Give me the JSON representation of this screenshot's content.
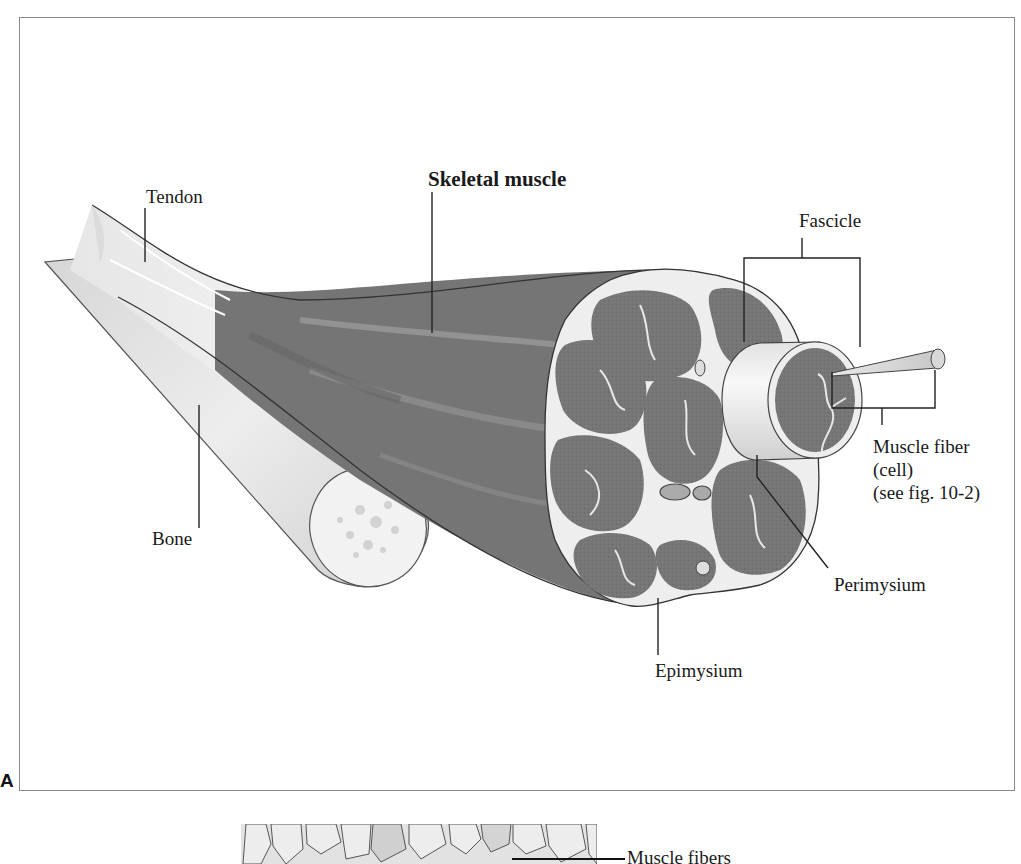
{
  "figure": {
    "panel_a": {
      "letter": "A",
      "labels": {
        "tendon": "Tendon",
        "skeletal_muscle": "Skeletal muscle",
        "fascicle": "Fascicle",
        "muscle_fiber_line1": "Muscle fiber",
        "muscle_fiber_line2": "(cell)",
        "muscle_fiber_line3": "(see fig. 10-2)",
        "bone": "Bone",
        "perimysium": "Perimysium",
        "epimysium": "Epimysium"
      }
    },
    "panel_b": {
      "labels": {
        "muscle_fibers": "Muscle fibers"
      }
    },
    "colors": {
      "muscle_dark": "#6e6e6e",
      "muscle_mid": "#858585",
      "fascicle_fill": "#7a7a7a",
      "connective": "#ececec",
      "bone": "#dcdcdc",
      "frame": "#8a8a8a"
    }
  }
}
